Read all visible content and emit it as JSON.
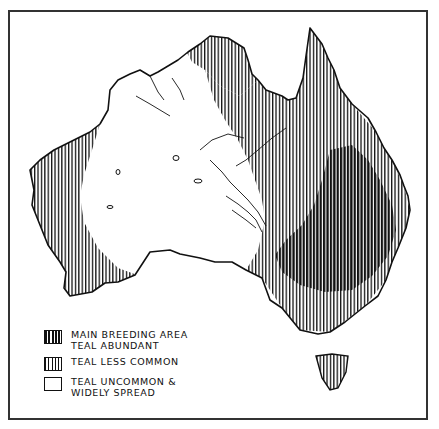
{
  "map": {
    "subject": "Australia teal distribution",
    "colors": {
      "ink": "#111111",
      "paper": "#ffffff",
      "frame": "#333333"
    }
  },
  "legend": {
    "items": [
      {
        "swatch": "dense-hatch",
        "lines": [
          "MAIN BREEDING AREA",
          "TEAL ABUNDANT"
        ]
      },
      {
        "swatch": "light-hatch",
        "lines": [
          "TEAL LESS COMMON"
        ]
      },
      {
        "swatch": "blank",
        "lines": [
          "TEAL UNCOMMON &",
          "WIDELY SPREAD"
        ]
      }
    ]
  }
}
